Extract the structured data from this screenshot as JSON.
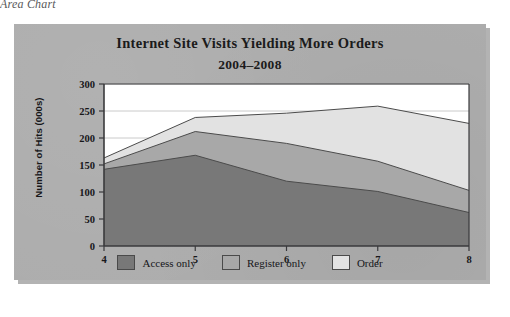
{
  "caption": "Area Chart",
  "chart_data": {
    "type": "area",
    "stacked": true,
    "title": "Internet Site Visits Yielding More Orders",
    "subtitle": "2004–2008",
    "xlabel": "",
    "ylabel": "Number of Hits (000s)",
    "x": [
      4,
      5,
      6,
      7,
      8
    ],
    "xticklabels": [
      "4",
      "5",
      "6",
      "7",
      "8"
    ],
    "yticklabels": [
      "0",
      "50",
      "100",
      "150",
      "200",
      "250",
      "300"
    ],
    "yticks": [
      0,
      50,
      100,
      150,
      200,
      250,
      300
    ],
    "ylim": [
      0,
      300
    ],
    "xlim": [
      4,
      8
    ],
    "grid": "horizontal",
    "legend_position": "bottom",
    "series": [
      {
        "name": "Access only",
        "color": "#787878",
        "values": [
          142,
          168,
          120,
          101,
          62
        ],
        "cumulative": [
          142,
          168,
          120,
          101,
          62
        ]
      },
      {
        "name": "Register only",
        "color": "#a8a8a8",
        "values": [
          10,
          44,
          70,
          56,
          41
        ],
        "cumulative": [
          152,
          212,
          190,
          157,
          103
        ]
      },
      {
        "name": "Order",
        "color": "#e2e2e2",
        "values": [
          11,
          26,
          56,
          102,
          124
        ],
        "cumulative": [
          163,
          238,
          246,
          259,
          227
        ]
      }
    ]
  },
  "legend": {
    "items": [
      {
        "label": "Access only",
        "color": "#787878"
      },
      {
        "label": "Register only",
        "color": "#a8a8a8"
      },
      {
        "label": "Order",
        "color": "#e2e2e2"
      }
    ]
  },
  "colors": {
    "plate": "#adadad",
    "plot_background": "#ffffff",
    "axis": "#3a3a3c",
    "gridline": "#bdbdbd",
    "text": "#17171a"
  }
}
